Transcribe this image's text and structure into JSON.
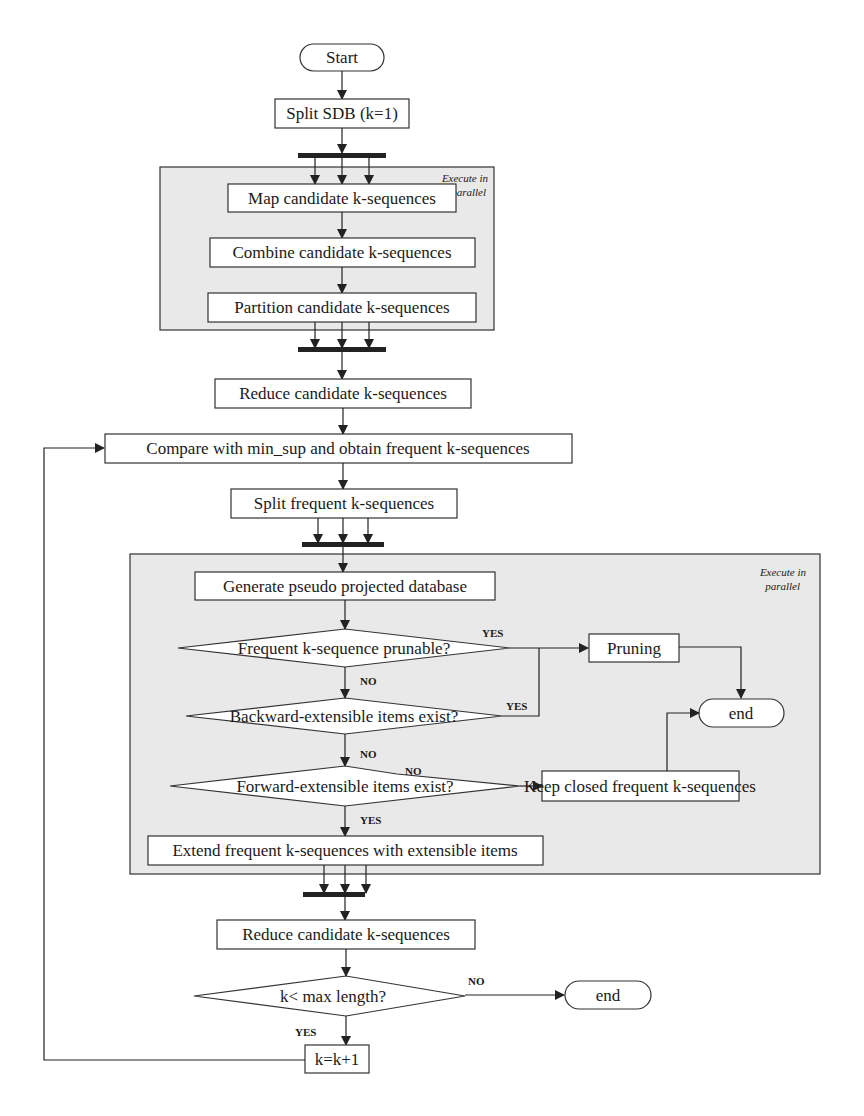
{
  "diagram": {
    "type": "flowchart",
    "start": "Start",
    "nodes": {
      "split_sdb": "Split SDB (k=1)",
      "map": "Map candidate k-sequences",
      "combine": "Combine candidate k-sequences",
      "partition": "Partition candidate k-sequences",
      "reduce1": "Reduce candidate k-sequences",
      "compare": "Compare with min_sup and obtain frequent k-sequences",
      "split_freq": "Split frequent k-sequences",
      "generate": "Generate pseudo projected database",
      "pruning": "Pruning",
      "keep_closed": "Keep closed frequent k-sequences",
      "extend": "Extend frequent k-sequences with extensible items",
      "reduce2": "Reduce candidate k-sequences",
      "increment": "k=k+1"
    },
    "decisions": {
      "prunable": "Frequent k-sequence prunable?",
      "backward": "Backward-extensible items exist?",
      "forward": "Forward-extensible items exist?",
      "max_length": "k< max length?"
    },
    "terminals": {
      "end_inner": "end",
      "end_outer": "end"
    },
    "edge_labels": {
      "prunable_yes": "YES",
      "prunable_no": "NO",
      "backward_yes": "YES",
      "backward_no": "NO",
      "forward_no": "NO",
      "forward_yes": "YES",
      "max_no": "NO",
      "max_yes": "YES"
    },
    "region_notes": {
      "region1_line1": "Execute in",
      "region1_line2": "parallel",
      "region2_line1": "Execute in",
      "region2_line2": "parallel"
    }
  }
}
